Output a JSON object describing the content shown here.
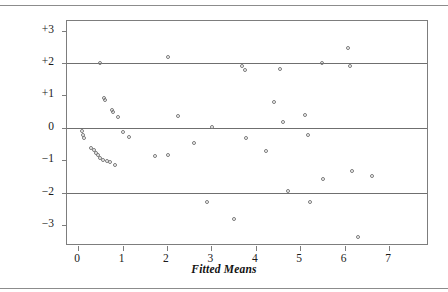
{
  "chart_data": {
    "type": "scatter",
    "title": "",
    "xlabel": "Fitted Means",
    "ylabel": "Deviance Residual",
    "xlim": [
      -0.25,
      7.9
    ],
    "ylim": [
      -3.65,
      3.3
    ],
    "xticks": [
      0,
      1,
      2,
      3,
      4,
      5,
      6,
      7
    ],
    "xticklabels": [
      "0",
      "1",
      "2",
      "3",
      "4",
      "5",
      "6",
      "7"
    ],
    "yticks": [
      3,
      2,
      1,
      0,
      -1,
      -2,
      -3
    ],
    "yticklabels": [
      "+3",
      "+2",
      "+1",
      "0",
      "−1",
      "−2",
      "−3"
    ],
    "grid": false,
    "reference_lines": [
      {
        "y": 2,
        "style": "solid"
      },
      {
        "y": 0,
        "style": "solid"
      },
      {
        "y": -2,
        "style": "solid"
      }
    ],
    "legend": null,
    "marker": "open-circle",
    "marker_color": "#7a7a7a",
    "points": [
      {
        "x": 0.08,
        "y": -0.1
      },
      {
        "x": 0.1,
        "y": -0.22
      },
      {
        "x": 0.14,
        "y": -0.32
      },
      {
        "x": 0.3,
        "y": -0.62
      },
      {
        "x": 0.36,
        "y": -0.7
      },
      {
        "x": 0.4,
        "y": -0.78
      },
      {
        "x": 0.45,
        "y": -0.85
      },
      {
        "x": 0.5,
        "y": -0.92
      },
      {
        "x": 0.56,
        "y": -0.98
      },
      {
        "x": 0.64,
        "y": -1.02
      },
      {
        "x": 0.72,
        "y": -1.05
      },
      {
        "x": 0.84,
        "y": -1.14
      },
      {
        "x": 0.5,
        "y": 2.0
      },
      {
        "x": 0.58,
        "y": 0.92
      },
      {
        "x": 0.6,
        "y": 0.86
      },
      {
        "x": 0.76,
        "y": 0.56
      },
      {
        "x": 0.79,
        "y": 0.5
      },
      {
        "x": 0.9,
        "y": 0.32
      },
      {
        "x": 1.02,
        "y": -0.14
      },
      {
        "x": 1.14,
        "y": -0.28
      },
      {
        "x": 1.72,
        "y": -0.88
      },
      {
        "x": 2.02,
        "y": 2.18
      },
      {
        "x": 2.02,
        "y": -0.85
      },
      {
        "x": 2.25,
        "y": 0.38
      },
      {
        "x": 2.62,
        "y": -0.46
      },
      {
        "x": 2.9,
        "y": -2.3
      },
      {
        "x": 3.02,
        "y": 0.02
      },
      {
        "x": 3.5,
        "y": -2.82
      },
      {
        "x": 3.68,
        "y": 1.92
      },
      {
        "x": 3.76,
        "y": 1.8
      },
      {
        "x": 3.78,
        "y": -0.32
      },
      {
        "x": 4.22,
        "y": -0.72
      },
      {
        "x": 4.4,
        "y": 0.8
      },
      {
        "x": 4.55,
        "y": 1.82
      },
      {
        "x": 4.62,
        "y": 0.18
      },
      {
        "x": 4.72,
        "y": -1.96
      },
      {
        "x": 5.1,
        "y": 0.4
      },
      {
        "x": 5.18,
        "y": -0.22
      },
      {
        "x": 5.22,
        "y": -2.28
      },
      {
        "x": 5.48,
        "y": 2.0
      },
      {
        "x": 5.52,
        "y": -1.58
      },
      {
        "x": 6.08,
        "y": 2.46
      },
      {
        "x": 6.12,
        "y": 1.92
      },
      {
        "x": 6.16,
        "y": -1.34
      },
      {
        "x": 6.3,
        "y": -3.38
      },
      {
        "x": 6.62,
        "y": -1.48
      }
    ]
  }
}
